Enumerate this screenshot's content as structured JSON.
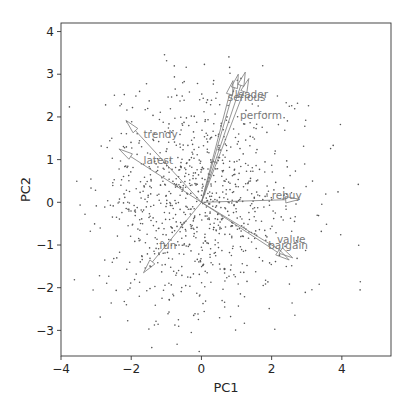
{
  "chart_data": {
    "type": "scatter",
    "subtype": "pca-biplot",
    "title": "",
    "xlabel": "PC1",
    "ylabel": "PC2",
    "xlim": [
      -4.0,
      5.4
    ],
    "ylim": [
      -3.6,
      4.2
    ],
    "xticks": [
      -4,
      -2,
      0,
      2,
      4
    ],
    "yticks": [
      -3,
      -2,
      -1,
      0,
      1,
      2,
      3,
      4
    ],
    "grid": false,
    "legend": null,
    "point_color": "#555555",
    "arrow_color": "#7a7a7a",
    "label_color": "#7a7a7a",
    "scores_cloud": {
      "description": "approx. 1000 respondent scores, roughly elliptical cloud centered near origin",
      "n": 1000,
      "center": [
        0.0,
        0.0
      ],
      "sd": [
        1.45,
        1.35
      ],
      "seed": 7
    },
    "loadings": [
      {
        "name": "leader",
        "x": 1.25,
        "y": 3.05,
        "label_x": 0.95,
        "label_y": 2.45
      },
      {
        "name": "serious",
        "x": 1.05,
        "y": 3.0,
        "label_x": 0.75,
        "label_y": 2.38
      },
      {
        "name": "latest_top",
        "x": 0.9,
        "y": 2.85,
        "label_x": null,
        "label_y": null
      },
      {
        "name": "perform",
        "x": 1.35,
        "y": 2.9,
        "label_x": 1.1,
        "label_y": 1.95
      },
      {
        "name": "trendy",
        "x": -2.15,
        "y": 1.92,
        "label_x": -1.65,
        "label_y": 1.5
      },
      {
        "name": "latest",
        "x": -2.35,
        "y": 1.25,
        "label_x": -1.65,
        "label_y": 0.9
      },
      {
        "name": "fun",
        "x": -1.65,
        "y": -1.65,
        "label_x": -1.2,
        "label_y": -1.1
      },
      {
        "name": "rebuy",
        "x": 2.8,
        "y": 0.07,
        "label_x": 2.0,
        "label_y": 0.08
      },
      {
        "name": "value",
        "x": 2.5,
        "y": -1.35,
        "label_x": 2.15,
        "label_y": -0.95
      },
      {
        "name": "bargain",
        "x": 2.6,
        "y": -1.3,
        "label_x": 1.9,
        "label_y": -1.1
      }
    ]
  }
}
